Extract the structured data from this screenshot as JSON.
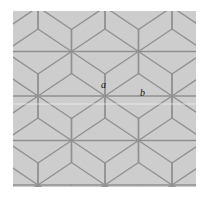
{
  "figure": {
    "name": "hexagonal-lattice-figure",
    "canvas": {
      "width": 211,
      "height": 197
    },
    "plate": {
      "x": 13,
      "y": 11,
      "width": 183,
      "height": 176
    },
    "colors": {
      "page_background": "#ffffff",
      "plate_background": "#cbcbcb",
      "line": "#8a8a8a",
      "line_dark": "#7e7e7e",
      "label": "#111111",
      "scanline": "#f0f0f0"
    },
    "line_width": 1.4,
    "scanline": {
      "y": 104,
      "opacity": 0.75
    }
  },
  "lattice": {
    "type": "elongated-hexagonal-tiling",
    "star_vertex_degree": 6,
    "period_x": 67,
    "period_y": 67,
    "row_offset_x": 33.5,
    "hex_half_width": 33.5,
    "hex_side_vertical": 22,
    "star_vertices": [
      {
        "x": 105,
        "y": 96,
        "label": "a"
      },
      {
        "x": 38,
        "y": 83
      },
      {
        "x": 172,
        "y": 109
      },
      {
        "x": 71,
        "y": 29
      },
      {
        "x": 138,
        "y": 42
      },
      {
        "x": 71,
        "y": 150
      },
      {
        "x": 138,
        "y": 163
      },
      {
        "x": 5,
        "y": 16
      },
      {
        "x": 5,
        "y": 150
      },
      {
        "x": 205,
        "y": 42
      },
      {
        "x": 205,
        "y": 176
      }
    ]
  },
  "labels": [
    {
      "id": "a",
      "text": "a",
      "x": 101,
      "y": 80,
      "font_size": 10
    },
    {
      "id": "b",
      "text": "b",
      "x": 140,
      "y": 88,
      "font_size": 10
    }
  ],
  "chart_data": {
    "type": "diagram",
    "title": "",
    "annotations": [
      {
        "label": "a",
        "refers_to": "six-way star vertex at lattice center",
        "x": 105,
        "y": 96
      },
      {
        "label": "b",
        "refers_to": "horizontal edge to the right of vertex a",
        "x": 143,
        "y": 96
      }
    ]
  }
}
